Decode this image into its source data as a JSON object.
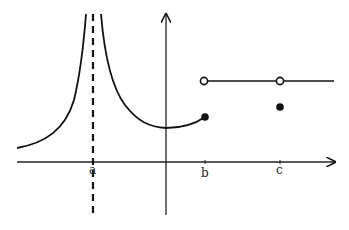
{
  "diagram": {
    "type": "function-graph",
    "axes": {
      "x_axis": {
        "y": 162,
        "x_start": 17,
        "x_end": 335
      },
      "y_axis": {
        "x": 166,
        "y_start": 215,
        "y_end": 14
      }
    },
    "tick_labels": [
      {
        "id": "a",
        "text": "a",
        "x": 93,
        "y": 175
      },
      {
        "id": "b",
        "text": "b",
        "x": 205,
        "y": 175
      },
      {
        "id": "c",
        "text": "c",
        "x": 280,
        "y": 175
      }
    ],
    "asymptote": {
      "label": "x = a",
      "x": 93,
      "y_top": 14,
      "y_bottom": 216,
      "style": "dashed"
    },
    "points": [
      {
        "name": "open-circle-b",
        "x": 204,
        "y": 81,
        "filled": false
      },
      {
        "name": "closed-dot-b",
        "x": 205,
        "y": 117,
        "filled": true
      },
      {
        "name": "open-circle-c",
        "x": 280,
        "y": 81,
        "filled": false
      },
      {
        "name": "closed-dot-c",
        "x": 280,
        "y": 107,
        "filled": true
      }
    ],
    "colors": {
      "stroke": "#111111",
      "background": "#ffffff"
    }
  }
}
